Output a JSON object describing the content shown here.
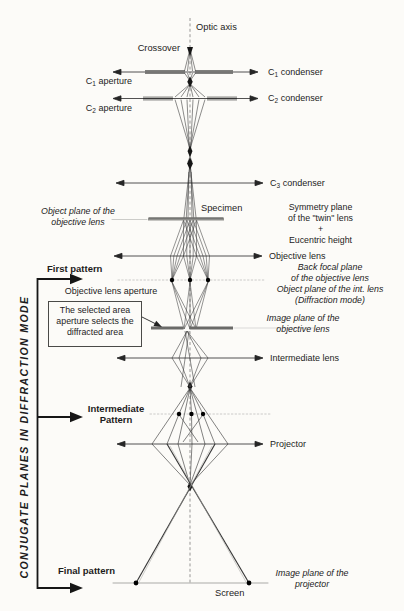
{
  "figure": {
    "colors": {
      "ink": "#1c1c1c",
      "ray": "#3f3f3f",
      "faint_line": "#c3c3c0",
      "paper": "#fcfbf8"
    }
  },
  "labels": {
    "optic_axis": "Optic axis",
    "crossover": "Crossover",
    "c1_aperture": {
      "base": "C",
      "sub": "1",
      "rest": " aperture"
    },
    "c2_aperture": {
      "base": "C",
      "sub": "2",
      "rest": " aperture"
    },
    "c1_condenser": {
      "base": "C",
      "sub": "1",
      "rest": " condenser"
    },
    "c2_condenser": {
      "base": "C",
      "sub": "2",
      "rest": " condenser"
    },
    "c3_condenser": {
      "base": "C",
      "sub": "3",
      "rest": " condenser"
    },
    "specimen": "Specimen",
    "object_plane_objective": "Object plane of the\nobjective lens",
    "symmetry_plane": "Symmetry plane\nof the \"twin\" lens\n+\nEucentric height",
    "objective_lens": "Objective lens",
    "first_pattern": "First pattern",
    "back_focal_plane": "Back focal plane\nof the objective lens\nObject plane of the int. lens\n(Diffraction mode)",
    "objective_lens_aperture": "Objective lens aperture",
    "selected_area_note": "The selected area\naperture selects the\ndiffracted area",
    "image_plane_objective": "Image plane of the\nobjective lens",
    "intermediate_lens": "Intermediate lens",
    "intermediate_pattern": "Intermediate\nPattern",
    "projector": "Projector",
    "final_pattern": "Final pattern",
    "screen": "Screen",
    "image_plane_projector": "Image plane of the\nprojector",
    "sidebar": "CONJUGATE PLANES IN DIFFRACTION MODE"
  }
}
